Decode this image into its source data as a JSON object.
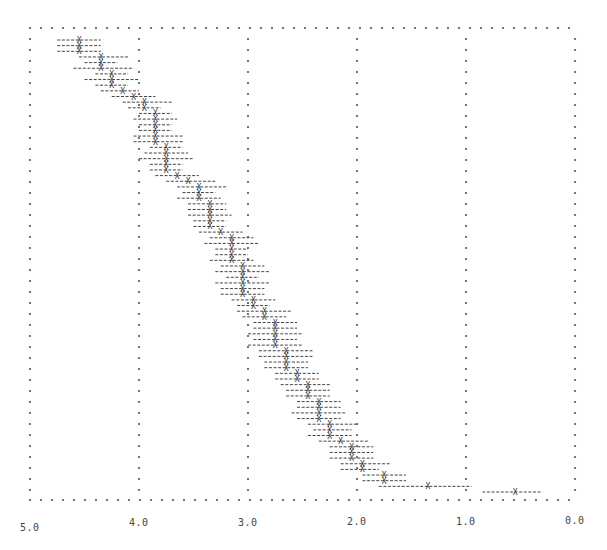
{
  "chart_data": {
    "type": "scatter",
    "title": "",
    "xlabel": "",
    "ylabel": "",
    "style": "line-printer plot: 'X' markers with dashed horizontal interval bars, dotted frame and gridlines",
    "x_axis": {
      "reversed": true,
      "range": [
        5.0,
        0.0
      ],
      "ticks": [
        "5.0",
        "4.0",
        "3.0",
        "2.0",
        "1.0",
        "0.0"
      ],
      "tick_values": [
        5.0,
        4.0,
        3.0,
        2.0,
        1.0,
        0.0
      ]
    },
    "grid": {
      "vertical": true,
      "horizontal": false,
      "frame": "dotted"
    },
    "legend": null,
    "colors": {
      "marker": "#333333",
      "bar": "#444444",
      "grid": "#555555",
      "background": "#ffffff"
    },
    "series": [
      {
        "name": "estimates",
        "note": "rows ordered top to bottom; value = X marker position, low/high = ends of dashed interval",
        "points": [
          {
            "row": 1,
            "value": 4.55,
            "low": 4.75,
            "high": 4.35
          },
          {
            "row": 2,
            "value": 4.55,
            "low": 4.75,
            "high": 4.35
          },
          {
            "row": 3,
            "value": 4.55,
            "low": 4.75,
            "high": 4.35
          },
          {
            "row": 4,
            "value": 4.35,
            "low": 4.55,
            "high": 4.1
          },
          {
            "row": 5,
            "value": 4.35,
            "low": 4.5,
            "high": 4.2
          },
          {
            "row": 6,
            "value": 4.35,
            "low": 4.6,
            "high": 4.05
          },
          {
            "row": 7,
            "value": 4.25,
            "low": 4.4,
            "high": 4.1
          },
          {
            "row": 8,
            "value": 4.25,
            "low": 4.5,
            "high": 4.0
          },
          {
            "row": 9,
            "value": 4.25,
            "low": 4.4,
            "high": 4.1
          },
          {
            "row": 10,
            "value": 4.15,
            "low": 4.35,
            "high": 4.0
          },
          {
            "row": 11,
            "value": 4.05,
            "low": 4.25,
            "high": 3.85
          },
          {
            "row": 12,
            "value": 3.95,
            "low": 4.15,
            "high": 3.7
          },
          {
            "row": 13,
            "value": 3.95,
            "low": 4.1,
            "high": 3.8
          },
          {
            "row": 14,
            "value": 3.85,
            "low": 4.0,
            "high": 3.7
          },
          {
            "row": 15,
            "value": 3.85,
            "low": 4.05,
            "high": 3.65
          },
          {
            "row": 16,
            "value": 3.85,
            "low": 4.0,
            "high": 3.7
          },
          {
            "row": 17,
            "value": 3.85,
            "low": 4.0,
            "high": 3.7
          },
          {
            "row": 18,
            "value": 3.85,
            "low": 4.05,
            "high": 3.6
          },
          {
            "row": 19,
            "value": 3.85,
            "low": 4.05,
            "high": 3.6
          },
          {
            "row": 20,
            "value": 3.75,
            "low": 3.9,
            "high": 3.6
          },
          {
            "row": 21,
            "value": 3.75,
            "low": 3.95,
            "high": 3.55
          },
          {
            "row": 22,
            "value": 3.75,
            "low": 4.0,
            "high": 3.5
          },
          {
            "row": 23,
            "value": 3.75,
            "low": 3.9,
            "high": 3.6
          },
          {
            "row": 24,
            "value": 3.75,
            "low": 3.9,
            "high": 3.6
          },
          {
            "row": 25,
            "value": 3.65,
            "low": 3.85,
            "high": 3.45
          },
          {
            "row": 26,
            "value": 3.55,
            "low": 3.75,
            "high": 3.3
          },
          {
            "row": 27,
            "value": 3.45,
            "low": 3.65,
            "high": 3.2
          },
          {
            "row": 28,
            "value": 3.45,
            "low": 3.6,
            "high": 3.3
          },
          {
            "row": 29,
            "value": 3.45,
            "low": 3.65,
            "high": 3.25
          },
          {
            "row": 30,
            "value": 3.35,
            "low": 3.55,
            "high": 3.2
          },
          {
            "row": 31,
            "value": 3.35,
            "low": 3.55,
            "high": 3.2
          },
          {
            "row": 32,
            "value": 3.35,
            "low": 3.55,
            "high": 3.15
          },
          {
            "row": 33,
            "value": 3.35,
            "low": 3.5,
            "high": 3.2
          },
          {
            "row": 34,
            "value": 3.35,
            "low": 3.5,
            "high": 3.2
          },
          {
            "row": 35,
            "value": 3.25,
            "low": 3.45,
            "high": 3.05
          },
          {
            "row": 36,
            "value": 3.15,
            "low": 3.35,
            "high": 2.95
          },
          {
            "row": 37,
            "value": 3.15,
            "low": 3.4,
            "high": 2.9
          },
          {
            "row": 38,
            "value": 3.15,
            "low": 3.3,
            "high": 3.0
          },
          {
            "row": 39,
            "value": 3.15,
            "low": 3.3,
            "high": 3.0
          },
          {
            "row": 40,
            "value": 3.15,
            "low": 3.35,
            "high": 2.95
          },
          {
            "row": 41,
            "value": 3.05,
            "low": 3.25,
            "high": 2.85
          },
          {
            "row": 42,
            "value": 3.05,
            "low": 3.3,
            "high": 2.8
          },
          {
            "row": 43,
            "value": 3.05,
            "low": 3.2,
            "high": 2.9
          },
          {
            "row": 44,
            "value": 3.05,
            "low": 3.3,
            "high": 2.8
          },
          {
            "row": 45,
            "value": 3.05,
            "low": 3.25,
            "high": 2.85
          },
          {
            "row": 46,
            "value": 3.05,
            "low": 3.25,
            "high": 2.85
          },
          {
            "row": 47,
            "value": 2.95,
            "low": 3.15,
            "high": 2.75
          },
          {
            "row": 48,
            "value": 2.95,
            "low": 3.1,
            "high": 2.8
          },
          {
            "row": 49,
            "value": 2.85,
            "low": 3.1,
            "high": 2.6
          },
          {
            "row": 50,
            "value": 2.85,
            "low": 3.05,
            "high": 2.65
          },
          {
            "row": 51,
            "value": 2.75,
            "low": 2.95,
            "high": 2.55
          },
          {
            "row": 52,
            "value": 2.75,
            "low": 2.95,
            "high": 2.55
          },
          {
            "row": 53,
            "value": 2.75,
            "low": 3.0,
            "high": 2.5
          },
          {
            "row": 54,
            "value": 2.75,
            "low": 2.95,
            "high": 2.55
          },
          {
            "row": 55,
            "value": 2.75,
            "low": 3.0,
            "high": 2.5
          },
          {
            "row": 56,
            "value": 2.65,
            "low": 2.9,
            "high": 2.4
          },
          {
            "row": 57,
            "value": 2.65,
            "low": 2.9,
            "high": 2.4
          },
          {
            "row": 58,
            "value": 2.65,
            "low": 2.85,
            "high": 2.45
          },
          {
            "row": 59,
            "value": 2.65,
            "low": 2.85,
            "high": 2.45
          },
          {
            "row": 60,
            "value": 2.55,
            "low": 2.75,
            "high": 2.35
          },
          {
            "row": 61,
            "value": 2.55,
            "low": 2.75,
            "high": 2.35
          },
          {
            "row": 62,
            "value": 2.45,
            "low": 2.7,
            "high": 2.25
          },
          {
            "row": 63,
            "value": 2.45,
            "low": 2.65,
            "high": 2.25
          },
          {
            "row": 64,
            "value": 2.45,
            "low": 2.65,
            "high": 2.25
          },
          {
            "row": 65,
            "value": 2.35,
            "low": 2.55,
            "high": 2.15
          },
          {
            "row": 66,
            "value": 2.35,
            "low": 2.55,
            "high": 2.15
          },
          {
            "row": 67,
            "value": 2.35,
            "low": 2.6,
            "high": 2.1
          },
          {
            "row": 68,
            "value": 2.35,
            "low": 2.55,
            "high": 2.15
          },
          {
            "row": 69,
            "value": 2.25,
            "low": 2.45,
            "high": 2.0
          },
          {
            "row": 70,
            "value": 2.25,
            "low": 2.4,
            "high": 2.05
          },
          {
            "row": 71,
            "value": 2.25,
            "low": 2.45,
            "high": 2.05
          },
          {
            "row": 72,
            "value": 2.15,
            "low": 2.35,
            "high": 1.9
          },
          {
            "row": 73,
            "value": 2.05,
            "low": 2.25,
            "high": 1.85
          },
          {
            "row": 74,
            "value": 2.05,
            "low": 2.25,
            "high": 1.85
          },
          {
            "row": 75,
            "value": 2.05,
            "low": 2.25,
            "high": 1.85
          },
          {
            "row": 76,
            "value": 1.95,
            "low": 2.15,
            "high": 1.7
          },
          {
            "row": 77,
            "value": 1.95,
            "low": 2.15,
            "high": 1.8
          },
          {
            "row": 78,
            "value": 1.75,
            "low": 1.95,
            "high": 1.55
          },
          {
            "row": 79,
            "value": 1.75,
            "low": 1.95,
            "high": 1.55
          },
          {
            "row": 80,
            "value": 1.35,
            "low": 1.8,
            "high": 0.95
          },
          {
            "row": 81,
            "value": 0.55,
            "low": 0.85,
            "high": 0.3
          }
        ]
      }
    ]
  }
}
